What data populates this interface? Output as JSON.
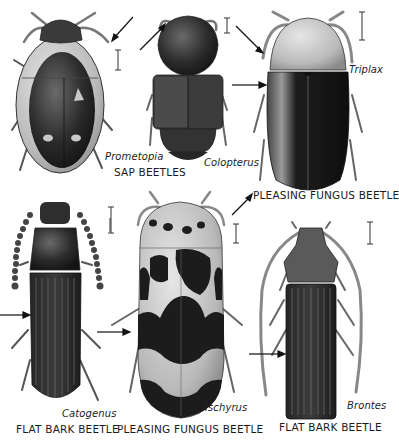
{
  "plate": {
    "specimens": [
      {
        "id": "prometopia",
        "genus": "Prometopia",
        "family_label": "SAP BEETLES",
        "pattern": "dark oval with pale margins and three pale spots"
      },
      {
        "id": "colopterus",
        "genus": "Colopterus",
        "family_label": "",
        "pattern": "dark compact body with truncated elytra"
      },
      {
        "id": "triplax",
        "genus": "Triplax",
        "family_label": "PLEASING FUNGUS BEETLE",
        "pattern": "speckled pronotum, black glossy elytra"
      },
      {
        "id": "catogenus",
        "genus": "Catogenus",
        "family_label": "FLAT BARK BEETLE",
        "pattern": "elongate dark body with striated elytra, beaded antennae"
      },
      {
        "id": "ischyrus",
        "genus": "Ischyrus",
        "family_label": "PLEASING FUNGUS BEETLE",
        "pattern": "pale body with black blotches and bands"
      },
      {
        "id": "brontes",
        "genus": "Brontes",
        "family_label": "FLAT BARK BEETLE",
        "pattern": "flat striated body, very long antennae"
      }
    ],
    "icons": [
      "arrow-pointer-icon",
      "scale-bar-icon"
    ],
    "colors": {
      "background": "#ffffff",
      "ink": "#1a1a1a",
      "dark_body": "#2b2b2b",
      "pale_body": "#bdbdbd"
    }
  }
}
